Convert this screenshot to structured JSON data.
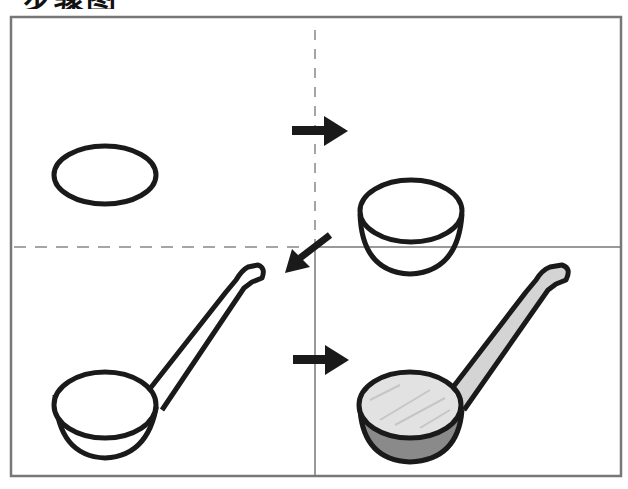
{
  "header": {
    "title": "步骤图"
  },
  "diagram": {
    "type": "step-by-step drawing tutorial",
    "panels": [
      {
        "step": 1,
        "position": "top-left",
        "description": "Draw an oval"
      },
      {
        "step": 2,
        "position": "top-right",
        "description": "Add a half-circle bowl under the oval"
      },
      {
        "step": 3,
        "position": "bottom-left",
        "description": "Add a long angled handle"
      },
      {
        "step": 4,
        "position": "bottom-right",
        "description": "Shade the ladle"
      }
    ],
    "arrows": [
      {
        "from": 1,
        "to": 2,
        "direction": "right"
      },
      {
        "from": 2,
        "to": 3,
        "direction": "down-left"
      },
      {
        "from": 3,
        "to": 4,
        "direction": "right"
      }
    ],
    "colors": {
      "outline": "#1a1a1a",
      "frame": "#777777",
      "divider_dashed": "#888888",
      "shade_light": "#d8d8d8",
      "shade_dark": "#8a8a8a",
      "background": "#ffffff"
    }
  }
}
